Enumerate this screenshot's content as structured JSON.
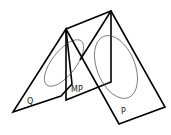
{
  "diagram": {
    "colors": {
      "edges": "#000000",
      "ellipses": "#555555",
      "labels": "#222222",
      "background": "#ffffff"
    },
    "planes": [
      {
        "id": "Q",
        "label": "Q"
      },
      {
        "id": "MP",
        "label": "MP"
      },
      {
        "id": "P",
        "label": "P"
      }
    ]
  }
}
